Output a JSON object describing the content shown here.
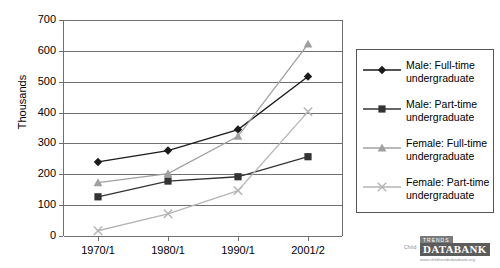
{
  "chart_data": {
    "type": "line",
    "title": "",
    "xlabel": "",
    "ylabel": "Thousands",
    "categories": [
      "1970/1",
      "1980/1",
      "1990/1",
      "2001/2"
    ],
    "ylim": [
      0,
      700
    ],
    "ytick_labels": [
      "0",
      "100",
      "200",
      "300",
      "400",
      "500",
      "600",
      "700"
    ],
    "ytick_values": [
      0,
      100,
      200,
      300,
      400,
      500,
      600,
      700
    ],
    "grid": "horizontal",
    "legend_position": "right",
    "series": [
      {
        "name": "Male: Full-time undergraduate",
        "name_line1": "Male: Full-time",
        "name_line2": "undergraduate",
        "marker": "diamond",
        "color": "#1a1a1a",
        "values": [
          240,
          277,
          345,
          517
        ]
      },
      {
        "name": "Male: Part-time undergraduate",
        "name_line1": "Male: Part-time",
        "name_line2": "undergraduate",
        "marker": "square",
        "color": "#333333",
        "values": [
          127,
          178,
          192,
          257
        ]
      },
      {
        "name": "Female: Full-time undergraduate",
        "name_line1": "Female: Full-time",
        "name_line2": "undergraduate",
        "marker": "triangle",
        "color": "#a0a0a0",
        "values": [
          173,
          202,
          323,
          622
        ]
      },
      {
        "name": "Female: Part-time undergraduate",
        "name_line1": "Female: Part-time",
        "name_line2": "undergraduate",
        "marker": "cross",
        "color": "#b5b5b5",
        "values": [
          17,
          72,
          147,
          403
        ]
      }
    ]
  },
  "watermark": {
    "child_text": "Child",
    "trends_text": "TRENDS",
    "databank_text": "DATABANK",
    "url_text": "www.childtrendsdatabank.org"
  }
}
